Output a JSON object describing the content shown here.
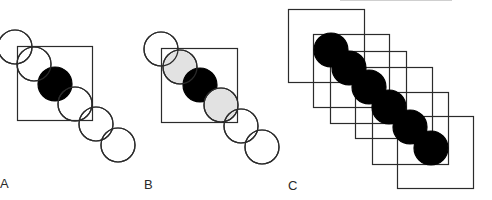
{
  "figure": {
    "colors": {
      "stroke": "#2b2b2b",
      "filled": "#000000",
      "shaded": "#e2e2e2",
      "empty": "#ffffff",
      "background": "#ffffff"
    },
    "radius": 17,
    "panels": [
      {
        "label": "A",
        "squares": [
          [
            17,
            46,
            75,
            74
          ]
        ],
        "circles": [
          {
            "cx": 15,
            "cy": 47,
            "fill": "empty"
          },
          {
            "cx": 34,
            "cy": 64,
            "fill": "empty"
          },
          {
            "cx": 55,
            "cy": 84,
            "fill": "filled"
          },
          {
            "cx": 75,
            "cy": 104,
            "fill": "empty"
          },
          {
            "cx": 96,
            "cy": 124,
            "fill": "empty"
          },
          {
            "cx": 118,
            "cy": 145,
            "fill": "empty"
          }
        ]
      },
      {
        "label": "B",
        "squares": [
          [
            161,
            48,
            76,
            74
          ]
        ],
        "circles": [
          {
            "cx": 161,
            "cy": 49,
            "fill": "empty"
          },
          {
            "cx": 180,
            "cy": 67,
            "fill": "shaded"
          },
          {
            "cx": 200,
            "cy": 85,
            "fill": "filled"
          },
          {
            "cx": 221,
            "cy": 105,
            "fill": "shaded"
          },
          {
            "cx": 241,
            "cy": 126,
            "fill": "empty"
          },
          {
            "cx": 262,
            "cy": 147,
            "fill": "empty"
          }
        ]
      },
      {
        "label": "C",
        "squares": [
          [
            288,
            9,
            76,
            73
          ],
          [
            313,
            34,
            76,
            73
          ],
          [
            330,
            51,
            76,
            72
          ],
          [
            355,
            67,
            77,
            71
          ],
          [
            372,
            92,
            76,
            72
          ],
          [
            397,
            116,
            76,
            72
          ]
        ],
        "circles": [
          {
            "cx": 331,
            "cy": 50,
            "fill": "filled"
          },
          {
            "cx": 349,
            "cy": 68,
            "fill": "filled"
          },
          {
            "cx": 369,
            "cy": 87,
            "fill": "filled"
          },
          {
            "cx": 389,
            "cy": 107,
            "fill": "filled"
          },
          {
            "cx": 410,
            "cy": 127,
            "fill": "filled"
          },
          {
            "cx": 431,
            "cy": 148,
            "fill": "filled"
          }
        ]
      }
    ]
  }
}
